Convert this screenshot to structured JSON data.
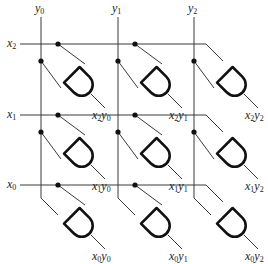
{
  "inputs": {
    "columns": [
      {
        "var": "y",
        "sub": "0"
      },
      {
        "var": "y",
        "sub": "1"
      },
      {
        "var": "y",
        "sub": "2"
      }
    ],
    "rows": [
      {
        "var": "x",
        "sub": "2"
      },
      {
        "var": "x",
        "sub": "1"
      },
      {
        "var": "x",
        "sub": "0"
      }
    ]
  },
  "outputs": [
    [
      {
        "a": "x",
        "as": "2",
        "b": "y",
        "bs": "0"
      },
      {
        "a": "x",
        "as": "2",
        "b": "y",
        "bs": "1"
      },
      {
        "a": "x",
        "as": "2",
        "b": "y",
        "bs": "2"
      }
    ],
    [
      {
        "a": "x",
        "as": "1",
        "b": "y",
        "bs": "0"
      },
      {
        "a": "x",
        "as": "1",
        "b": "y",
        "bs": "1"
      },
      {
        "a": "x",
        "as": "1",
        "b": "y",
        "bs": "2"
      }
    ],
    [
      {
        "a": "x",
        "as": "0",
        "b": "y",
        "bs": "0"
      },
      {
        "a": "x",
        "as": "0",
        "b": "y",
        "bs": "1"
      },
      {
        "a": "x",
        "as": "0",
        "b": "y",
        "bs": "2"
      }
    ]
  ],
  "colors": {
    "wire": "#3a3a3a",
    "gate": "#111111",
    "background": "#ffffff"
  }
}
